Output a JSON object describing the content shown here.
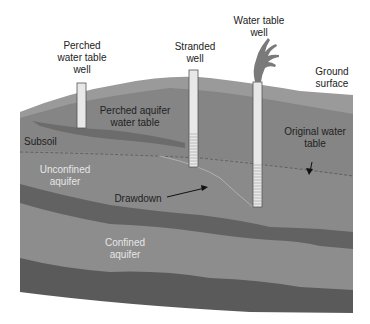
{
  "diagram": {
    "title": "",
    "type": "groundwater cross-section",
    "colors": {
      "background": "#ffffff",
      "surface_band": "#9a9a9a",
      "upper_soil": "#858585",
      "perched_clay": "#6c6c6c",
      "subsoil": "#7e7e7e",
      "unconfined_aquifer": "#8a8a8a",
      "confining_layer": "#626262",
      "confined_aquifer": "#8d8d8d",
      "bedrock": "#5a5a5a",
      "well_casing": "#e8e8e8",
      "well_outline": "#555555",
      "water_plume": "#7a7a7a",
      "dashed_line": "#5e5e5e",
      "drawdown_curve": "#b0b0b0",
      "arrow": "#111111"
    },
    "labels": {
      "perched_well": "Perched\nwater table\nwell",
      "stranded_well": "Stranded\nwell",
      "water_table_well": "Water table\nwell",
      "ground_surface": "Ground\nsurface",
      "perched_aquifer": "Perched aquifer\nwater table",
      "subsoil": "Subsoil",
      "original_water_table": "Original water\ntable",
      "unconfined_aquifer": "Unconfined\naquifer",
      "drawdown": "Drawdown",
      "confined_aquifer": "Confined\naquifer"
    },
    "wells": [
      {
        "name": "perched water table well",
        "x": 77,
        "top": 83,
        "bottom": 128,
        "screened": false
      },
      {
        "name": "stranded well",
        "x": 189,
        "top": 70,
        "bottom": 167,
        "screened": true
      },
      {
        "name": "water table well",
        "x": 253,
        "top": 82,
        "bottom": 207,
        "screened": true
      }
    ]
  }
}
